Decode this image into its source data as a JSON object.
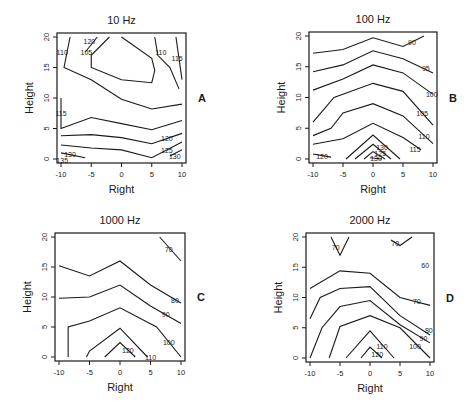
{
  "chart_data": [
    {
      "type": "contour",
      "panel_letter": "A",
      "title": "10 Hz",
      "xlabel": "Right",
      "ylabel": "Height",
      "xlim": [
        -10,
        10
      ],
      "ylim": [
        0,
        20
      ],
      "xticks": [
        -10,
        -5,
        0,
        5,
        10
      ],
      "yticks": [
        0,
        5,
        10,
        15,
        20
      ],
      "frame_px": {
        "x0": 57,
        "y0": 33,
        "x1": 186,
        "y1": 163
      },
      "contours": [
        {
          "level": 110,
          "points": [
            [
              -8.5,
              20
            ],
            [
              -9.5,
              15
            ],
            [
              -5,
              13
            ],
            [
              0,
              9.8
            ],
            [
              5,
              8.2
            ],
            [
              10,
              9
            ]
          ],
          "label": "110",
          "label_at": [
            -9.8,
            17.5
          ]
        },
        {
          "level": 105,
          "points": [
            [
              -2,
              20
            ],
            [
              -5,
              17
            ],
            [
              -5,
              15
            ],
            [
              0,
              13
            ],
            [
              5,
              12.5
            ],
            [
              5.5,
              14.5
            ],
            [
              5,
              16.5
            ],
            [
              0,
              20
            ]
          ],
          "label": "105",
          "label_at": [
            -5.8,
            17.5
          ]
        },
        {
          "level": 110,
          "points": [
            [
              5.5,
              20
            ],
            [
              6,
              17
            ],
            [
              8,
              15
            ],
            [
              9.5,
              11.5
            ]
          ],
          "label": "110",
          "label_at": [
            6.5,
            17.5
          ]
        },
        {
          "level": 115,
          "points": [
            [
              9,
              20
            ],
            [
              10,
              13
            ]
          ],
          "label": "115",
          "label_at": [
            9.2,
            16.5
          ]
        },
        {
          "level": 120,
          "points": [
            [
              -4,
              20
            ],
            [
              -6,
              17.5
            ]
          ],
          "label": "120",
          "label_at": [
            -5.3,
            19.3
          ]
        },
        {
          "level": 115,
          "points": [
            [
              -10,
              10
            ],
            [
              -10,
              5
            ],
            [
              -5,
              6.8
            ],
            [
              0,
              5.8
            ],
            [
              5,
              4.8
            ],
            [
              10,
              6.3
            ]
          ],
          "label": "115",
          "label_at": [
            -10,
            7.5
          ]
        },
        {
          "level": 120,
          "points": [
            [
              -10,
              3.8
            ],
            [
              -5,
              4
            ],
            [
              0,
              3.5
            ],
            [
              5,
              2.5
            ],
            [
              10,
              4.2
            ]
          ],
          "label": "120",
          "label_at": [
            7.5,
            3.5
          ]
        },
        {
          "level": 125,
          "points": [
            [
              -10,
              2.3
            ],
            [
              -5,
              1.8
            ],
            [
              0,
              1.5
            ],
            [
              5,
              0.2
            ],
            [
              10,
              2.8
            ]
          ],
          "label": "125",
          "label_at": [
            7.5,
            1.5
          ]
        },
        {
          "level": 130,
          "points": [
            [
              -10,
              1
            ],
            [
              -6,
              0.2
            ]
          ],
          "label": "130",
          "label_at": [
            -8.5,
            0.8
          ]
        },
        {
          "level": 130,
          "points": [
            [
              8,
              0.5
            ],
            [
              10,
              1.5
            ]
          ],
          "label": "130",
          "label_at": [
            8.8,
            0.5
          ]
        },
        {
          "level": 135,
          "points": [
            [
              -10,
              0
            ]
          ],
          "label": "135",
          "label_at": [
            -9.8,
            -0.2
          ]
        }
      ]
    },
    {
      "type": "contour",
      "panel_letter": "B",
      "title": "100 Hz",
      "xlabel": "Right",
      "ylabel": "Height",
      "xlim": [
        -10,
        10
      ],
      "ylim": [
        0,
        20
      ],
      "xticks": [
        -10,
        -5,
        0,
        5,
        10
      ],
      "yticks": [
        0,
        5,
        10,
        15,
        20
      ],
      "frame_px": {
        "x0": 309,
        "y0": 32,
        "x1": 437,
        "y1": 163
      },
      "contours": [
        {
          "level": 90,
          "points": [
            [
              -10,
              17.2
            ],
            [
              -5,
              17.8
            ],
            [
              0,
              19.7
            ],
            [
              5,
              18.3
            ],
            [
              8.5,
              20
            ]
          ],
          "label": "90",
          "label_at": [
            6.5,
            19
          ]
        },
        {
          "level": 95,
          "points": [
            [
              -10,
              14.2
            ],
            [
              -5,
              15.3
            ],
            [
              0,
              17.6
            ],
            [
              5,
              16.3
            ],
            [
              10,
              14
            ]
          ],
          "label": "95",
          "label_at": [
            8.8,
            14.8
          ]
        },
        {
          "level": 100,
          "points": [
            [
              -10,
              11.2
            ],
            [
              -5,
              13
            ],
            [
              0,
              15.3
            ],
            [
              5,
              14
            ],
            [
              10,
              10.5
            ]
          ],
          "label": "100",
          "label_at": [
            9.8,
            10.5
          ]
        },
        {
          "level": 105,
          "points": [
            [
              -10,
              6
            ],
            [
              -6.5,
              10
            ],
            [
              0,
              12.3
            ],
            [
              5,
              11
            ],
            [
              10,
              5.5
            ]
          ],
          "label": "105",
          "label_at": [
            8.2,
            7.5
          ]
        },
        {
          "level": 110,
          "points": [
            [
              -10,
              3.8
            ],
            [
              -7,
              5
            ],
            [
              -5,
              7.5
            ],
            [
              0,
              9
            ],
            [
              5,
              7
            ],
            [
              10,
              2.5
            ]
          ],
          "label": "110",
          "label_at": [
            8.5,
            3.8
          ]
        },
        {
          "level": 115,
          "points": [
            [
              -10,
              2.4
            ],
            [
              -5,
              3.3
            ],
            [
              0,
              5.8
            ],
            [
              5,
              3.5
            ],
            [
              8,
              1.5
            ]
          ],
          "label": "115",
          "label_at": [
            7,
            1.6
          ]
        },
        {
          "level": 120,
          "points": [
            [
              -10,
              0.8
            ],
            [
              -7,
              0.3
            ]
          ],
          "label": "120",
          "label_at": [
            -8.5,
            0.5
          ]
        },
        {
          "level": 125,
          "points": [
            [
              -4.5,
              0
            ],
            [
              0,
              3.9
            ],
            [
              4.5,
              0
            ]
          ],
          "label": "",
          "label_at": null
        },
        {
          "level": 130,
          "points": [
            [
              -3,
              0
            ],
            [
              0,
              2.4
            ],
            [
              3,
              0
            ]
          ],
          "label": "130",
          "label_at": [
            1.5,
            2
          ]
        },
        {
          "level": 135,
          "points": [
            [
              -1.5,
              0
            ],
            [
              0,
              1.2
            ],
            [
              2,
              0
            ]
          ],
          "label": "125",
          "label_at": [
            1.2,
            1
          ]
        },
        {
          "level": 130,
          "points": [
            [
              -0.5,
              0.2
            ],
            [
              1.5,
              0
            ]
          ],
          "label": "130",
          "label_at": [
            0.5,
            0.2
          ]
        }
      ]
    },
    {
      "type": "contour",
      "panel_letter": "C",
      "title": "1000 Hz",
      "xlabel": "Right",
      "ylabel": "Height",
      "xlim": [
        -10,
        10
      ],
      "ylim": [
        0,
        20
      ],
      "xticks": [
        -10,
        -5,
        0,
        5,
        10
      ],
      "yticks": [
        0,
        5,
        10,
        15,
        20
      ],
      "frame_px": {
        "x0": 55,
        "y0": 233,
        "x1": 185,
        "y1": 361
      },
      "contours": [
        {
          "level": 70,
          "points": [
            [
              6.5,
              20
            ],
            [
              10,
              16
            ]
          ],
          "label": "70",
          "label_at": [
            8,
            18
          ]
        },
        {
          "level": 80,
          "points": [
            [
              -10,
              15.2
            ],
            [
              -5,
              13.5
            ],
            [
              0,
              16
            ],
            [
              5,
              12
            ],
            [
              10,
              9
            ]
          ],
          "label": "80",
          "label_at": [
            9,
            9.5
          ]
        },
        {
          "level": 90,
          "points": [
            [
              -10,
              9.8
            ],
            [
              -5,
              10
            ],
            [
              0,
              12
            ],
            [
              5,
              8.5
            ],
            [
              10,
              5.6
            ]
          ],
          "label": "90",
          "label_at": [
            7.5,
            7.2
          ]
        },
        {
          "level": 100,
          "points": [
            [
              -8.5,
              0
            ],
            [
              -8.5,
              5
            ],
            [
              -5,
              6
            ],
            [
              0,
              8.2
            ],
            [
              6,
              5
            ],
            [
              10,
              0
            ]
          ],
          "label": "100",
          "label_at": [
            8,
            2.5
          ]
        },
        {
          "level": 110,
          "points": [
            [
              -5.5,
              0
            ],
            [
              -5,
              1
            ],
            [
              0,
              4.8
            ],
            [
              4.5,
              0
            ]
          ],
          "label": "110",
          "label_at": [
            5,
            0
          ]
        },
        {
          "level": 120,
          "points": [
            [
              -2.5,
              0
            ],
            [
              0,
              2.4
            ],
            [
              2.5,
              0
            ]
          ],
          "label": "120",
          "label_at": [
            1.3,
            1.2
          ]
        }
      ]
    },
    {
      "type": "contour",
      "panel_letter": "D",
      "title": "2000 Hz",
      "xlabel": "Right",
      "ylabel": "Height",
      "xlim": [
        -10,
        10
      ],
      "ylim": [
        0,
        20
      ],
      "xticks": [
        -10,
        -5,
        0,
        5,
        10
      ],
      "yticks": [
        0,
        5,
        10,
        15,
        20
      ],
      "frame_px": {
        "x0": 306,
        "y0": 233,
        "x1": 434,
        "y1": 362
      },
      "contours": [
        {
          "level": 70,
          "points": [
            [
              -6.5,
              20
            ],
            [
              -5,
              17
            ],
            [
              -3.5,
              20
            ]
          ],
          "label": "70",
          "label_at": [
            -5.7,
            18.3
          ]
        },
        {
          "level": 70,
          "points": [
            [
              3.5,
              19.5
            ],
            [
              5,
              18.6
            ],
            [
              7,
              20
            ]
          ],
          "label": "70",
          "label_at": [
            4.2,
            19
          ]
        },
        {
          "level": 60,
          "points": [],
          "label": "60",
          "label_at": [
            9.2,
            15.3
          ]
        },
        {
          "level": 70,
          "points": [
            [
              -10,
              11.5
            ],
            [
              -5,
              14.4
            ],
            [
              0,
              14
            ],
            [
              5,
              10
            ],
            [
              10,
              8.7
            ]
          ],
          "label": "70",
          "label_at": [
            7.8,
            9.4
          ]
        },
        {
          "level": 80,
          "points": [
            [
              -10,
              6.5
            ],
            [
              -8.3,
              10
            ],
            [
              -5,
              11.5
            ],
            [
              0,
              11.8
            ],
            [
              5,
              7
            ],
            [
              10,
              3.8
            ]
          ],
          "label": "80",
          "label_at": [
            9.8,
            4.6
          ]
        },
        {
          "level": 90,
          "points": [
            [
              -10,
              0
            ],
            [
              -8,
              5
            ],
            [
              -5,
              8.5
            ],
            [
              0,
              9.5
            ],
            [
              5,
              5.5
            ],
            [
              10,
              2.5
            ]
          ],
          "label": "90",
          "label_at": [
            8.9,
            3.3
          ]
        },
        {
          "level": 100,
          "points": [
            [
              -6.8,
              0
            ],
            [
              -5,
              5.2
            ],
            [
              0,
              7
            ],
            [
              5,
              5
            ],
            [
              10,
              0
            ]
          ],
          "label": "100",
          "label_at": [
            7.5,
            2
          ]
        },
        {
          "level": 110,
          "points": [
            [
              -4,
              0
            ],
            [
              0,
              4.5
            ],
            [
              4,
              0
            ]
          ],
          "label": "110",
          "label_at": [
            2,
            2
          ]
        },
        {
          "level": 120,
          "points": [
            [
              -1.5,
              0
            ],
            [
              0,
              1.8
            ],
            [
              2,
              0
            ]
          ],
          "label": "120",
          "label_at": [
            1.2,
            0.7
          ]
        }
      ]
    }
  ]
}
